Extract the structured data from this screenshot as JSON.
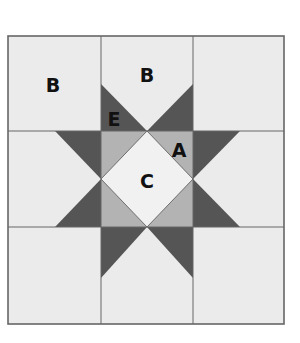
{
  "diagram": {
    "grid": {
      "rows": 3,
      "cols": 3
    },
    "colors": {
      "background": "#ebebeb",
      "dark": "#555555",
      "medium": "#b3b3b3",
      "center": "#f1f1f1",
      "grid_line": "#666666"
    },
    "labels": [
      {
        "id": "B1",
        "text": "B",
        "x": 53,
        "y": 92
      },
      {
        "id": "B2",
        "text": "B",
        "x": 147,
        "y": 82
      },
      {
        "id": "E",
        "text": "E",
        "x": 114,
        "y": 126
      },
      {
        "id": "A",
        "text": "A",
        "x": 179,
        "y": 157
      },
      {
        "id": "C",
        "text": "C",
        "x": 147,
        "y": 188
      }
    ]
  }
}
